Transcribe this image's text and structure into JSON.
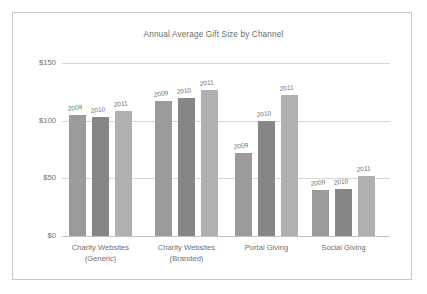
{
  "chart_data": {
    "type": "bar",
    "title": "Annual Average Gift Size by Channel",
    "xlabel": "",
    "ylabel": "",
    "ylim": [
      0,
      150
    ],
    "yticks": [
      "$0",
      "$50",
      "$100",
      "$150"
    ],
    "ytick_values": [
      0,
      50,
      100,
      150
    ],
    "grid": true,
    "legend_position": "none",
    "annotations": "Each bar is labeled above with its year.",
    "categories": [
      "Charity Websites\n(Generic)",
      "Charity Websites\n(Branded)",
      "Portal Giving",
      "Social Giving"
    ],
    "series": [
      {
        "name": "2009",
        "color": "#9b9b9b",
        "values": [
          105,
          117,
          72,
          40
        ]
      },
      {
        "name": "2010",
        "color": "#868686",
        "values": [
          103,
          120,
          100,
          41
        ]
      },
      {
        "name": "2011",
        "color": "#b0b0b0",
        "values": [
          108,
          127,
          122,
          52
        ]
      }
    ],
    "bars": [
      {
        "group": 0,
        "year": "2009",
        "value": 105
      },
      {
        "group": 0,
        "year": "2010",
        "value": 103
      },
      {
        "group": 0,
        "year": "2011",
        "value": 108
      },
      {
        "group": 1,
        "year": "2009",
        "value": 117
      },
      {
        "group": 1,
        "year": "2010",
        "value": 120
      },
      {
        "group": 1,
        "year": "2011",
        "value": 127
      },
      {
        "group": 2,
        "year": "2009",
        "value": 72
      },
      {
        "group": 2,
        "year": "2010",
        "value": 100
      },
      {
        "group": 2,
        "year": "2011",
        "value": 122
      },
      {
        "group": 3,
        "year": "2009",
        "value": 40
      },
      {
        "group": 3,
        "year": "2010",
        "value": 41
      },
      {
        "group": 3,
        "year": "2011",
        "value": 52
      }
    ]
  },
  "colors": {
    "frame_border": "#c9c9c9",
    "gridline": "#d6d6d6",
    "text": "#6f6f6f",
    "background": "#ffffff"
  }
}
